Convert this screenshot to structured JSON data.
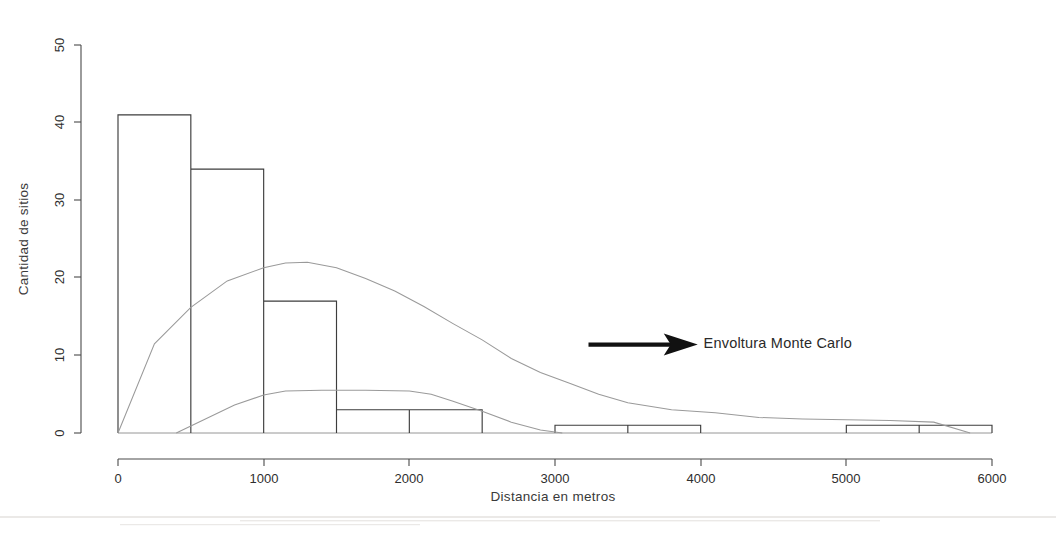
{
  "chart_data": {
    "type": "bar",
    "title": "",
    "xlabel": "Distancia en metros",
    "ylabel": "Cantidad de sitios",
    "xlim": [
      0,
      6200
    ],
    "ylim": [
      0,
      52
    ],
    "grid": false,
    "legend_position": "none",
    "x_ticks": [
      0,
      1000,
      2000,
      3000,
      4000,
      5000,
      6000
    ],
    "x_tick_labels": [
      "0",
      "1000",
      "2000",
      "3000",
      "4000",
      "5000",
      "6000"
    ],
    "y_ticks": [
      0,
      10,
      20,
      30,
      40,
      50
    ],
    "y_tick_labels": [
      "0",
      "10",
      "20",
      "30",
      "40",
      "50"
    ],
    "bin_width": 500,
    "categories": [
      "0-500",
      "500-1000",
      "1000-1500",
      "1500-2000",
      "2000-2500",
      "2500-3000",
      "3000-3500",
      "3500-4000",
      "4000-4500",
      "4500-5000",
      "5000-5500",
      "5500-6000"
    ],
    "bin_edges": [
      0,
      500,
      1000,
      1500,
      2000,
      2500,
      3000,
      3500,
      4000,
      4500,
      5000,
      5500,
      6000
    ],
    "values": [
      41,
      34,
      17,
      3,
      3,
      0,
      1,
      1,
      0,
      0,
      1,
      1
    ],
    "series": [
      {
        "name": "Histograma observado",
        "kind": "bar",
        "values": [
          41,
          34,
          17,
          3,
          3,
          0,
          1,
          1,
          0,
          0,
          1,
          1
        ]
      },
      {
        "name": "Envoltura Monte Carlo superior",
        "kind": "line",
        "x": [
          0,
          250,
          500,
          750,
          1000,
          1150,
          1300,
          1500,
          1700,
          1900,
          2100,
          2300,
          2500,
          2700,
          2900,
          3100,
          3300,
          3500,
          3800,
          4100,
          4400,
          4700,
          5000,
          5300,
          5600,
          5850
        ],
        "y": [
          0,
          11.5,
          16.2,
          19.6,
          21.3,
          21.9,
          22.0,
          21.3,
          19.9,
          18.3,
          16.3,
          14.1,
          12.0,
          9.6,
          7.8,
          6.4,
          5.0,
          3.9,
          3.0,
          2.6,
          2.0,
          1.8,
          1.7,
          1.6,
          1.4,
          0.0
        ]
      },
      {
        "name": "Envoltura Monte Carlo inferior",
        "kind": "line",
        "x": [
          400,
          600,
          800,
          1000,
          1150,
          1400,
          1700,
          2000,
          2150,
          2300,
          2500,
          2700,
          2900,
          3050
        ],
        "y": [
          0,
          1.8,
          3.6,
          4.9,
          5.4,
          5.5,
          5.5,
          5.4,
          5.0,
          4.1,
          2.8,
          1.4,
          0.4,
          0.0
        ]
      }
    ],
    "annotations": [
      {
        "name": "envoltura-monte-carlo",
        "text": "Envoltura Monte Carlo",
        "arrow": true,
        "arrow_direction": "right",
        "arrow_x_start": 3230,
        "arrow_x_end": 3980,
        "arrow_y": 11.4,
        "text_x": 4020,
        "text_y": 11.4
      }
    ]
  },
  "colors": {
    "background": "#ffffff",
    "axis": "#4a4a4a",
    "bar_stroke": "#3d3d3d",
    "envelope_stroke": "#9a9a9a",
    "annotation": "#111111",
    "text": "#2b2b2b"
  }
}
